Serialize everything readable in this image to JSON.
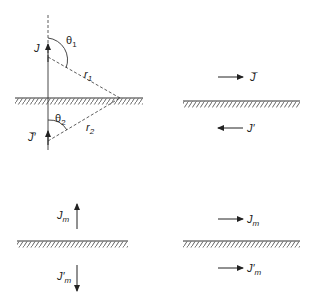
{
  "diagram": {
    "panels": [
      {
        "id": "top-left",
        "description": "Electric current element J above perfect conductor with image J' below",
        "labels": {
          "source": "J",
          "image": "J̅′",
          "theta1": "θ",
          "theta1_sub": "1",
          "theta2": "θ",
          "theta2_sub": "2",
          "r1": "r",
          "r1_sub": "1",
          "r2": "r",
          "r2_sub": "2"
        }
      },
      {
        "id": "top-right",
        "description": "Horizontal electric current J with opposite-direction image J'",
        "labels": {
          "source": "J̅",
          "image": "J′"
        }
      },
      {
        "id": "bottom-left",
        "description": "Vertical magnetic current Jm with opposite image J'm",
        "labels": {
          "source": "J",
          "source_sub": "m",
          "image": "J′",
          "image_sub": "m"
        }
      },
      {
        "id": "bottom-right",
        "description": "Horizontal magnetic current Jm with same-direction image J'm",
        "labels": {
          "source": "J",
          "source_sub": "m",
          "image": "J′",
          "image_sub": "m"
        }
      }
    ],
    "colors": {
      "line": "#333333",
      "hatch": "#555555",
      "background": "#ffffff"
    }
  }
}
